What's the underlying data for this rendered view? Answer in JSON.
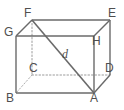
{
  "figure": {
    "kind": "rectangular-prism-diagram",
    "stroke_color": "#6a6a6a",
    "hidden_stroke_color": "#9a9a9a",
    "label_color": "#4f4f4f",
    "background_color": "#ffffff"
  },
  "vertices": {
    "F": {
      "label": "F",
      "x": 32,
      "y": 20,
      "label_x": 24,
      "label_y": 7
    },
    "E": {
      "label": "E",
      "x": 110,
      "y": 20,
      "label_x": 108,
      "label_y": 7
    },
    "G": {
      "label": "G",
      "x": 16,
      "y": 36,
      "label_x": 4,
      "label_y": 26
    },
    "H": {
      "label": "H",
      "x": 94,
      "y": 36,
      "label_x": 92,
      "label_y": 35
    },
    "C": {
      "label": "C",
      "x": 32,
      "y": 75,
      "label_x": 29,
      "label_y": 62
    },
    "D": {
      "label": "D",
      "x": 110,
      "y": 75,
      "label_x": 105,
      "label_y": 62
    },
    "B": {
      "label": "B",
      "x": 16,
      "y": 93,
      "label_x": 6,
      "label_y": 92
    },
    "A": {
      "label": "A",
      "x": 94,
      "y": 93,
      "label_x": 90,
      "label_y": 92
    }
  },
  "diagonal": {
    "label": "d",
    "from": "F",
    "to": "A",
    "label_x": 62,
    "label_y": 48
  },
  "edges": {
    "visible": [
      "F-E",
      "G-H",
      "F-G",
      "E-H",
      "G-B",
      "H-A",
      "E-D",
      "B-A",
      "A-D"
    ],
    "hidden": [
      "F-C",
      "C-D",
      "C-B"
    ]
  }
}
